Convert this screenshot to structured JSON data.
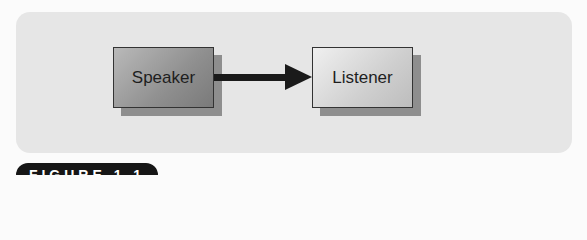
{
  "diagram": {
    "nodes": [
      {
        "id": "speaker",
        "label": "Speaker"
      },
      {
        "id": "listener",
        "label": "Listener"
      }
    ],
    "edges": [
      {
        "from": "speaker",
        "to": "listener",
        "type": "arrow"
      }
    ]
  },
  "figure_label": "FIGURE 1.1"
}
